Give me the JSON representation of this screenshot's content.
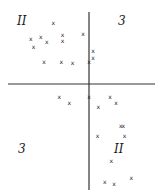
{
  "chart_data": {
    "type": "scatter",
    "title": "",
    "xlabel": "",
    "ylabel": "",
    "xlim": [
      -1,
      1
    ],
    "ylim": [
      -1,
      1
    ],
    "grid": false,
    "marker_glyph": "x",
    "quadrant_labels": [
      {
        "quadrant": "top-left",
        "text": "II"
      },
      {
        "quadrant": "top-right",
        "text": "3"
      },
      {
        "quadrant": "bottom-left",
        "text": "3"
      },
      {
        "quadrant": "bottom-right",
        "text": "II"
      }
    ],
    "points": [
      {
        "x": -0.54,
        "y": 0.85
      },
      {
        "x": -0.88,
        "y": 0.63
      },
      {
        "x": -0.84,
        "y": 0.51
      },
      {
        "x": -0.73,
        "y": 0.66
      },
      {
        "x": -0.64,
        "y": 0.59
      },
      {
        "x": -0.4,
        "y": 0.68
      },
      {
        "x": -0.4,
        "y": 0.6
      },
      {
        "x": -0.09,
        "y": 0.7
      },
      {
        "x": -0.68,
        "y": 0.3
      },
      {
        "x": -0.42,
        "y": 0.3
      },
      {
        "x": -0.25,
        "y": 0.29
      },
      {
        "x": 0.06,
        "y": 0.46
      },
      {
        "x": 0.06,
        "y": 0.36
      },
      {
        "x": 0.0,
        "y": 0.31
      },
      {
        "x": -0.45,
        "y": -0.13
      },
      {
        "x": -0.3,
        "y": -0.19
      },
      {
        "x": 0.0,
        "y": -0.13
      },
      {
        "x": 0.14,
        "y": -0.23
      },
      {
        "x": 0.32,
        "y": -0.13
      },
      {
        "x": 0.41,
        "y": -0.19
      },
      {
        "x": 0.13,
        "y": -0.52
      },
      {
        "x": 0.48,
        "y": -0.42
      },
      {
        "x": 0.52,
        "y": -0.42
      },
      {
        "x": 0.54,
        "y": -0.52
      },
      {
        "x": 0.34,
        "y": -0.77
      },
      {
        "x": 0.24,
        "y": -0.98
      },
      {
        "x": 0.38,
        "y": -1.0
      },
      {
        "x": 0.64,
        "y": -0.94
      }
    ]
  }
}
